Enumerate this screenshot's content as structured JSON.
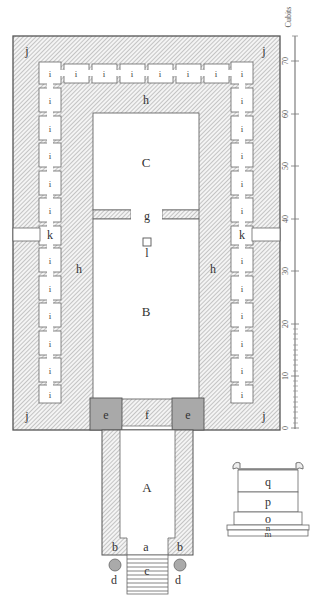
{
  "diagram": {
    "type": "architectural floor plan",
    "colors": {
      "wall_hatch": "#8a8a8a",
      "wall_fill": "#f2f2f2",
      "outline": "#555555",
      "pillar_fill": "#a9a9a9",
      "room_fill": "#ffffff"
    },
    "labels": {
      "porch": "A",
      "holy_place": "B",
      "most_holy": "C",
      "porch_entry": "a",
      "porch_jamb": "b",
      "steps": "c",
      "column": "d",
      "pillar": "e",
      "doorway": "f",
      "partition_door": "g",
      "wall": "h",
      "side_chamber": "i",
      "corner": "j",
      "side_entry": "k",
      "altar_incense": "l"
    },
    "side_chambers": {
      "top_row_count": 8,
      "left_column_above_k": 5,
      "left_column_below_k": 6,
      "right_column_above_k": 5,
      "right_column_below_k": 6
    },
    "inset_altar": {
      "tiers": [
        "q",
        "p",
        "o",
        "n",
        "m"
      ]
    },
    "scale": {
      "unit_label": "Cubits",
      "ticks": [
        "0",
        "10",
        "20",
        "30",
        "40",
        "50",
        "60",
        "70"
      ],
      "minor_ticks_range": [
        0,
        20
      ]
    }
  }
}
